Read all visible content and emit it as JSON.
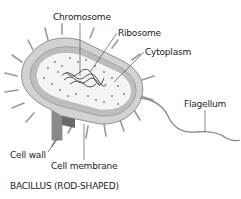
{
  "diagram": {
    "labels": {
      "chromosome": "Chromosome",
      "ribosome": "Ribosome",
      "cytoplasm": "Cytoplasm",
      "flagellum": "Flagellum",
      "cell_wall": "Cell wall",
      "cell_membrane": "Cell membrane"
    },
    "caption": "BACILLUS (ROD-SHAPED)",
    "colors": {
      "outer": "#d9d9d9",
      "inner": "#f2f2f2",
      "wall_dark": "#8a8a8a",
      "line": "#555555"
    }
  }
}
